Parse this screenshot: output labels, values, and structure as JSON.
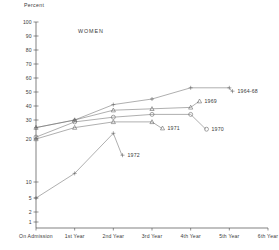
{
  "chart_data": {
    "type": "line",
    "title": "WOMEN",
    "xlabel": "",
    "ylabel": "Percent",
    "scale": "probit",
    "grid": false,
    "legend_position": "right-inline",
    "categories": [
      "On Admission",
      "1st Year",
      "2nd Year",
      "3rd Year",
      "4th Year",
      "5th Year",
      "6th Year"
    ],
    "ytick_labels": [
      "100",
      "90",
      "80",
      "70",
      "60",
      "50",
      "40",
      "30",
      "20",
      "10",
      "5",
      "2",
      "1"
    ],
    "ytick_values": [
      100,
      90,
      80,
      70,
      60,
      50,
      40,
      30,
      20,
      10,
      5,
      2,
      1
    ],
    "ylim": [
      1,
      100
    ],
    "series": [
      {
        "name": "1964-68",
        "marker": "plus",
        "label": "1964-68",
        "x": [
          "On Admission",
          "1st Year",
          "2nd Year",
          "3rd Year",
          "4th Year",
          "5th Year"
        ],
        "values": [
          26,
          30,
          41,
          45,
          53,
          53
        ]
      },
      {
        "name": "1969",
        "marker": "triangle",
        "label": "1969",
        "x": [
          "On Admission",
          "1st Year",
          "2nd Year",
          "3rd Year",
          "4th Year"
        ],
        "values": [
          26,
          30,
          37,
          38,
          39
        ]
      },
      {
        "name": "1970",
        "marker": "circle",
        "label": "1970",
        "x": [
          "On Admission",
          "1st Year",
          "2nd Year",
          "3rd Year",
          "4th Year"
        ],
        "values": [
          21,
          29,
          32,
          34,
          34
        ]
      },
      {
        "name": "1971",
        "marker": "triangle",
        "label": "1971",
        "x": [
          "On Admission",
          "1st Year",
          "2nd Year",
          "3rd Year"
        ],
        "values": [
          20,
          26,
          29,
          29
        ]
      },
      {
        "name": "1972",
        "marker": "plus",
        "label": "1972",
        "x": [
          "On Admission",
          "1st Year",
          "2nd Year"
        ],
        "values": [
          5,
          12,
          23
        ]
      }
    ]
  }
}
